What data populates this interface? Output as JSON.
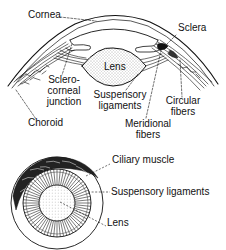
{
  "diagram": {
    "top_view": {
      "labels": {
        "cornea": "Cornea",
        "sclera": "Sclera",
        "lens": "Lens",
        "sclero_corneal_line1": "Sclero-",
        "sclero_corneal_line2": "corneal",
        "sclero_corneal_line3": "junction",
        "suspensory_line1": "Suspensory",
        "suspensory_line2": "ligaments",
        "circular_line1": "Circular",
        "circular_line2": "fibers",
        "choroid": "Choroid",
        "meridional_line1": "Meridional",
        "meridional_line2": "fibers"
      }
    },
    "front_view": {
      "labels": {
        "ciliary_muscle": "Ciliary muscle",
        "suspensory_ligaments": "Suspensory ligaments",
        "lens": "Lens"
      }
    },
    "colors": {
      "ink": "#111111",
      "background": "#ffffff"
    }
  }
}
